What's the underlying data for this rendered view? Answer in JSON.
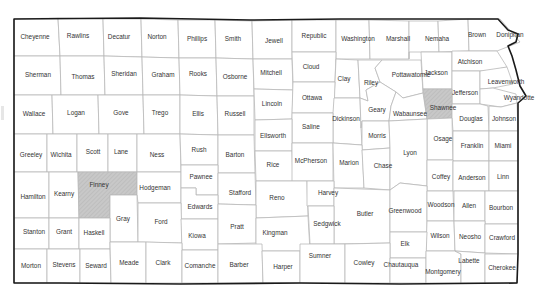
{
  "map": {
    "region": "Kansas",
    "highlight_color": "#c8c8c8",
    "border_color": "#1a1a1a",
    "county_line_color": "#b9b9b9",
    "highlighted": [
      "Finney",
      "Shawnee"
    ],
    "counties": [
      {
        "name": "Cheyenne",
        "x": 35,
        "y": 37
      },
      {
        "name": "Rawlins",
        "x": 78,
        "y": 36
      },
      {
        "name": "Decatur",
        "x": 119,
        "y": 37
      },
      {
        "name": "Norton",
        "x": 157,
        "y": 37
      },
      {
        "name": "Phillips",
        "x": 197,
        "y": 39
      },
      {
        "name": "Smith",
        "x": 233,
        "y": 39
      },
      {
        "name": "Jewell",
        "x": 274,
        "y": 41
      },
      {
        "name": "Republic",
        "x": 314,
        "y": 36
      },
      {
        "name": "Washington",
        "x": 358,
        "y": 39
      },
      {
        "name": "Marshall",
        "x": 398,
        "y": 39
      },
      {
        "name": "Nemaha",
        "x": 437,
        "y": 39
      },
      {
        "name": "Brown",
        "x": 477,
        "y": 35
      },
      {
        "name": "Doniphan",
        "x": 510,
        "y": 35
      },
      {
        "name": "Sherman",
        "x": 38,
        "y": 75
      },
      {
        "name": "Thomas",
        "x": 83,
        "y": 77
      },
      {
        "name": "Sheridan",
        "x": 124,
        "y": 74
      },
      {
        "name": "Graham",
        "x": 163,
        "y": 75
      },
      {
        "name": "Rooks",
        "x": 198,
        "y": 74
      },
      {
        "name": "Osborne",
        "x": 235,
        "y": 77
      },
      {
        "name": "Mitchell",
        "x": 271,
        "y": 73
      },
      {
        "name": "Cloud",
        "x": 311,
        "y": 67
      },
      {
        "name": "Clay",
        "x": 344,
        "y": 79
      },
      {
        "name": "Riley",
        "x": 371,
        "y": 83
      },
      {
        "name": "Pottawatomie",
        "x": 411,
        "y": 75
      },
      {
        "name": "Jackson",
        "x": 436,
        "y": 73
      },
      {
        "name": "Atchison",
        "x": 470,
        "y": 62
      },
      {
        "name": "Leavenworth",
        "x": 506,
        "y": 82
      },
      {
        "name": "Jefferson",
        "x": 465,
        "y": 93
      },
      {
        "name": "Wyandotte",
        "x": 519,
        "y": 98
      },
      {
        "name": "Wallace",
        "x": 34,
        "y": 114
      },
      {
        "name": "Logan",
        "x": 76,
        "y": 113
      },
      {
        "name": "Gove",
        "x": 121,
        "y": 113
      },
      {
        "name": "Trego",
        "x": 160,
        "y": 113
      },
      {
        "name": "Ellis",
        "x": 198,
        "y": 114
      },
      {
        "name": "Russell",
        "x": 235,
        "y": 114
      },
      {
        "name": "Lincoln",
        "x": 272,
        "y": 104
      },
      {
        "name": "Ottawa",
        "x": 312,
        "y": 98
      },
      {
        "name": "Shawnee",
        "x": 443,
        "y": 108
      },
      {
        "name": "Geary",
        "x": 377,
        "y": 110
      },
      {
        "name": "Wabaunsee",
        "x": 410,
        "y": 114
      },
      {
        "name": "Dickinson",
        "x": 346,
        "y": 119
      },
      {
        "name": "Douglas",
        "x": 471,
        "y": 119
      },
      {
        "name": "Johnson",
        "x": 504,
        "y": 119
      },
      {
        "name": "Saline",
        "x": 311,
        "y": 127
      },
      {
        "name": "Ellsworth",
        "x": 273,
        "y": 136
      },
      {
        "name": "Morris",
        "x": 377,
        "y": 136
      },
      {
        "name": "Osage",
        "x": 443,
        "y": 139
      },
      {
        "name": "Franklin",
        "x": 472,
        "y": 146
      },
      {
        "name": "Miami",
        "x": 503,
        "y": 146
      },
      {
        "name": "Greeley",
        "x": 31,
        "y": 155
      },
      {
        "name": "Wichita",
        "x": 61,
        "y": 155
      },
      {
        "name": "Scott",
        "x": 93,
        "y": 152
      },
      {
        "name": "Lane",
        "x": 121,
        "y": 152
      },
      {
        "name": "Ness",
        "x": 157,
        "y": 155
      },
      {
        "name": "Rush",
        "x": 199,
        "y": 150
      },
      {
        "name": "Barton",
        "x": 235,
        "y": 155
      },
      {
        "name": "Lyon",
        "x": 410,
        "y": 153
      },
      {
        "name": "McPherson",
        "x": 311,
        "y": 161
      },
      {
        "name": "Marion",
        "x": 349,
        "y": 163
      },
      {
        "name": "Chase",
        "x": 383,
        "y": 166
      },
      {
        "name": "Rice",
        "x": 273,
        "y": 165
      },
      {
        "name": "Coffey",
        "x": 441,
        "y": 177
      },
      {
        "name": "Anderson",
        "x": 472,
        "y": 178
      },
      {
        "name": "Linn",
        "x": 503,
        "y": 177
      },
      {
        "name": "Hamilton",
        "x": 33,
        "y": 197
      },
      {
        "name": "Kearny",
        "x": 64,
        "y": 194
      },
      {
        "name": "Finney",
        "x": 99,
        "y": 185
      },
      {
        "name": "Hodgeman",
        "x": 155,
        "y": 188
      },
      {
        "name": "Pawnee",
        "x": 201,
        "y": 177
      },
      {
        "name": "Stafford",
        "x": 240,
        "y": 193
      },
      {
        "name": "Reno",
        "x": 277,
        "y": 198
      },
      {
        "name": "Harvey",
        "x": 328,
        "y": 193
      },
      {
        "name": "Butler",
        "x": 365,
        "y": 214
      },
      {
        "name": "Greenwood",
        "x": 405,
        "y": 211
      },
      {
        "name": "Woodson",
        "x": 441,
        "y": 205
      },
      {
        "name": "Allen",
        "x": 469,
        "y": 206
      },
      {
        "name": "Bourbon",
        "x": 501,
        "y": 208
      },
      {
        "name": "Edwards",
        "x": 200,
        "y": 207
      },
      {
        "name": "Gray",
        "x": 123,
        "y": 219
      },
      {
        "name": "Ford",
        "x": 161,
        "y": 222
      },
      {
        "name": "Stanton",
        "x": 34,
        "y": 232
      },
      {
        "name": "Grant",
        "x": 64,
        "y": 232
      },
      {
        "name": "Haskell",
        "x": 94,
        "y": 233
      },
      {
        "name": "Kiowa",
        "x": 197,
        "y": 236
      },
      {
        "name": "Pratt",
        "x": 237,
        "y": 227
      },
      {
        "name": "Kingman",
        "x": 275,
        "y": 233
      },
      {
        "name": "Sedgwick",
        "x": 327,
        "y": 224
      },
      {
        "name": "Wilson",
        "x": 440,
        "y": 236
      },
      {
        "name": "Neosho",
        "x": 470,
        "y": 237
      },
      {
        "name": "Crawford",
        "x": 502,
        "y": 238
      },
      {
        "name": "Elk",
        "x": 405,
        "y": 244
      },
      {
        "name": "Morton",
        "x": 31,
        "y": 266
      },
      {
        "name": "Stevens",
        "x": 64,
        "y": 265
      },
      {
        "name": "Seward",
        "x": 96,
        "y": 266
      },
      {
        "name": "Meade",
        "x": 129,
        "y": 263
      },
      {
        "name": "Clark",
        "x": 163,
        "y": 263
      },
      {
        "name": "Comanche",
        "x": 200,
        "y": 266
      },
      {
        "name": "Barber",
        "x": 239,
        "y": 265
      },
      {
        "name": "Harper",
        "x": 283,
        "y": 267
      },
      {
        "name": "Sumner",
        "x": 320,
        "y": 256
      },
      {
        "name": "Cowley",
        "x": 364,
        "y": 263
      },
      {
        "name": "Chautauqua",
        "x": 401,
        "y": 265
      },
      {
        "name": "Labette",
        "x": 469,
        "y": 261
      },
      {
        "name": "Montgomery",
        "x": 443,
        "y": 272
      },
      {
        "name": "Cherokee",
        "x": 502,
        "y": 268
      }
    ]
  }
}
